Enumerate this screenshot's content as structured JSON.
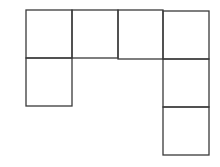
{
  "diagram": {
    "type": "square-net",
    "stroke_color": "#3a3a3a",
    "stroke_width": 1.3,
    "cell_count": 7,
    "cells": [
      {
        "id": "r0c0",
        "row": 0,
        "col": 0,
        "x": 26,
        "y": 10,
        "w": 46,
        "h": 48
      },
      {
        "id": "r0c1",
        "row": 0,
        "col": 1,
        "x": 72,
        "y": 10,
        "w": 46,
        "h": 48
      },
      {
        "id": "r0c2",
        "row": 0,
        "col": 2,
        "x": 118,
        "y": 10,
        "w": 45,
        "h": 49
      },
      {
        "id": "r0c3",
        "row": 0,
        "col": 3,
        "x": 163,
        "y": 11,
        "w": 46,
        "h": 48
      },
      {
        "id": "r1c0",
        "row": 1,
        "col": 0,
        "x": 26,
        "y": 58,
        "w": 46,
        "h": 48
      },
      {
        "id": "r1c3",
        "row": 1,
        "col": 3,
        "x": 163,
        "y": 59,
        "w": 46,
        "h": 48
      },
      {
        "id": "r2c3",
        "row": 2,
        "col": 3,
        "x": 163,
        "y": 107,
        "w": 46,
        "h": 48
      }
    ]
  }
}
